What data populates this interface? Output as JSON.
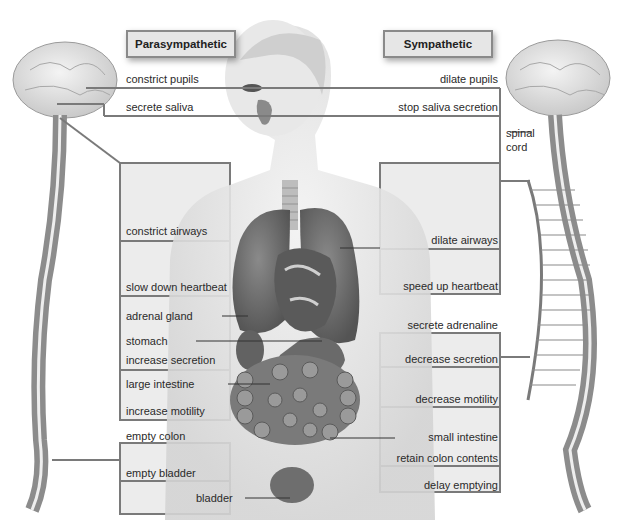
{
  "headers": {
    "parasympathetic": "Parasympathetic",
    "sympathetic": "Sympathetic"
  },
  "parasympathetic_labels": {
    "constrict_pupils": "constrict pupils",
    "secrete_saliva": "secrete saliva",
    "constrict_airways": "constrict airways",
    "slow_down_heartbeat": "slow down heartbeat",
    "adrenal_gland": "adrenal gland",
    "stomach": "stomach",
    "increase_secretion": "increase secretion",
    "large_intestine": "large intestine",
    "increase_motility": "increase motility",
    "empty_colon": "empty colon",
    "empty_bladder": "empty bladder",
    "bladder": "bladder"
  },
  "sympathetic_labels": {
    "dilate_pupils": "dilate pupils",
    "stop_saliva_secretion": "stop saliva secretion",
    "spinal_cord": "spinal\ncord",
    "dilate_airways": "dilate airways",
    "speed_up_heartbeat": "speed up heartbeat",
    "secrete_adrenaline": "secrete adrenaline",
    "decrease_secretion": "decrease secretion",
    "decrease_motility": "decrease motility",
    "small_intestine": "small intestine",
    "retain_colon_contents": "retain colon contents",
    "delay_emptying": "delay emptying"
  },
  "colors": {
    "line": "#7a7a7a",
    "box_fill": "#ececec",
    "organ": "#6e6e6e",
    "skin": "#e2e2e2",
    "spine": "#8c8c8c"
  }
}
